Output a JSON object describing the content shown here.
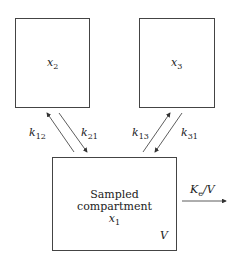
{
  "diagram": {
    "type": "three-compartment pharmacokinetic model",
    "compartments": [
      {
        "id": "x2",
        "var": "x",
        "sub": "2"
      },
      {
        "id": "x3",
        "var": "x",
        "sub": "3"
      },
      {
        "id": "x1",
        "title_line1": "Sampled",
        "title_line2": "compartment",
        "var": "x",
        "sub": "1",
        "volume": "V"
      }
    ],
    "rates": {
      "k12": {
        "var": "k",
        "sub": "12"
      },
      "k21": {
        "var": "k",
        "sub": "21"
      },
      "k13": {
        "var": "k",
        "sub": "13"
      },
      "k31": {
        "var": "k",
        "sub": "31"
      },
      "elimination": {
        "var": "K",
        "sub": "e",
        "suffix": "/V"
      }
    }
  }
}
